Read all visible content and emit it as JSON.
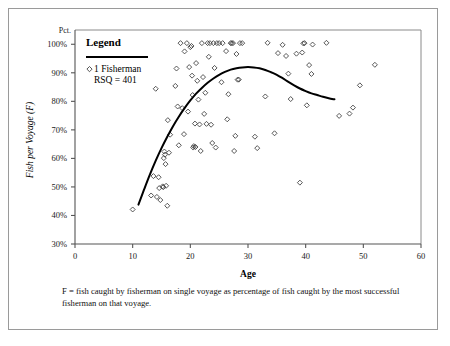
{
  "figure": {
    "y_axis_unit_label": "Pct.",
    "y_axis_title": "Fish per Voyage (F)",
    "x_axis_title": "Age",
    "caption": "F = fish caught by fisherman on single voyage as percentage of fish caught by the most successful fisherman on that voyage."
  },
  "legend": {
    "title": "Legend",
    "marker_label": "1 Fisherman",
    "rsq_label": "RSQ = 401"
  },
  "chart_data": {
    "type": "scatter",
    "title": "",
    "subtitle": "",
    "xlabel": "Age",
    "ylabel": "Fish per Voyage (F)",
    "ylabel_unit": "Pct.",
    "xlim": [
      0,
      60
    ],
    "ylim": [
      30,
      105
    ],
    "xticks": [
      0,
      10,
      20,
      30,
      40,
      50,
      60
    ],
    "yticks": [
      30,
      40,
      50,
      60,
      70,
      80,
      90,
      100
    ],
    "ytick_labels": [
      "30%",
      "40%",
      "50%",
      "60%",
      "70%",
      "80%",
      "90%",
      "100%"
    ],
    "xtick_labels": [
      "0",
      "10",
      "20",
      "30",
      "40",
      "50",
      "60"
    ],
    "grid": false,
    "legend_position": "top-left",
    "series": [
      {
        "name": "1 Fisherman",
        "type": "scatter",
        "marker": "open-diamond",
        "points": [
          [
            10.0,
            42.1
          ],
          [
            13.2,
            47.0
          ],
          [
            13.6,
            53.8
          ],
          [
            14.0,
            84.4
          ],
          [
            14.2,
            46.5
          ],
          [
            14.5,
            53.4
          ],
          [
            14.6,
            49.6
          ],
          [
            14.8,
            45.4
          ],
          [
            15.2,
            50.2
          ],
          [
            15.3,
            49.9
          ],
          [
            15.4,
            60.1
          ],
          [
            15.5,
            62.4
          ],
          [
            15.6,
            61.3
          ],
          [
            15.7,
            58.0
          ],
          [
            15.8,
            50.4
          ],
          [
            16.0,
            43.4
          ],
          [
            16.1,
            73.4
          ],
          [
            16.3,
            62.0
          ],
          [
            16.5,
            68.3
          ],
          [
            17.4,
            85.4
          ],
          [
            17.6,
            91.5
          ],
          [
            17.8,
            78.2
          ],
          [
            18.0,
            64.6
          ],
          [
            18.3,
            100.4
          ],
          [
            18.6,
            77.6
          ],
          [
            18.9,
            68.5
          ],
          [
            19.0,
            97.5
          ],
          [
            19.4,
            100.4
          ],
          [
            19.6,
            76.4
          ],
          [
            19.8,
            92.0
          ],
          [
            20.0,
            99.0
          ],
          [
            20.2,
            99.4
          ],
          [
            20.3,
            89.0
          ],
          [
            20.4,
            82.2
          ],
          [
            20.5,
            63.8
          ],
          [
            20.6,
            64.3
          ],
          [
            20.8,
            72.2
          ],
          [
            20.9,
            64.0
          ],
          [
            21.0,
            93.4
          ],
          [
            21.2,
            87.2
          ],
          [
            21.4,
            80.6
          ],
          [
            21.6,
            71.9
          ],
          [
            21.8,
            62.6
          ],
          [
            22.0,
            100.4
          ],
          [
            22.2,
            88.5
          ],
          [
            22.4,
            75.6
          ],
          [
            22.6,
            83.0
          ],
          [
            22.8,
            72.1
          ],
          [
            23.0,
            100.4
          ],
          [
            23.2,
            95.6
          ],
          [
            23.4,
            100.4
          ],
          [
            23.6,
            71.8
          ],
          [
            23.8,
            65.4
          ],
          [
            24.0,
            100.4
          ],
          [
            24.2,
            91.7
          ],
          [
            24.4,
            63.8
          ],
          [
            24.6,
            100.4
          ],
          [
            25.0,
            100.4
          ],
          [
            25.4,
            86.7
          ],
          [
            25.6,
            100.4
          ],
          [
            26.2,
            97.6
          ],
          [
            26.4,
            73.7
          ],
          [
            26.6,
            82.5
          ],
          [
            27.0,
            100.4
          ],
          [
            27.2,
            100.4
          ],
          [
            27.4,
            100.4
          ],
          [
            27.6,
            62.6
          ],
          [
            27.8,
            67.9
          ],
          [
            28.0,
            96.6
          ],
          [
            28.2,
            87.6
          ],
          [
            28.4,
            87.6
          ],
          [
            28.6,
            100.4
          ],
          [
            29.0,
            100.4
          ],
          [
            31.2,
            67.6
          ],
          [
            31.6,
            63.6
          ],
          [
            33.0,
            81.7
          ],
          [
            33.4,
            100.5
          ],
          [
            34.6,
            68.8
          ],
          [
            35.2,
            96.9
          ],
          [
            36.0,
            99.8
          ],
          [
            36.6,
            95.9
          ],
          [
            37.0,
            89.7
          ],
          [
            37.4,
            80.8
          ],
          [
            38.4,
            96.7
          ],
          [
            39.0,
            51.5
          ],
          [
            39.4,
            97.1
          ],
          [
            39.6,
            100.3
          ],
          [
            39.8,
            100.4
          ],
          [
            40.2,
            78.6
          ],
          [
            40.6,
            92.7
          ],
          [
            41.0,
            89.6
          ],
          [
            41.2,
            99.9
          ],
          [
            43.6,
            100.5
          ],
          [
            45.8,
            74.9
          ],
          [
            47.6,
            75.7
          ],
          [
            48.2,
            77.8
          ],
          [
            49.4,
            85.6
          ],
          [
            52.0,
            92.8
          ]
        ]
      },
      {
        "name": "Fitted curve",
        "type": "line",
        "points": [
          [
            11.0,
            43.8
          ],
          [
            12.0,
            49.2
          ],
          [
            13.0,
            54.4
          ],
          [
            14.0,
            59.2
          ],
          [
            15.0,
            63.6
          ],
          [
            16.0,
            67.6
          ],
          [
            17.0,
            71.3
          ],
          [
            18.0,
            74.6
          ],
          [
            19.0,
            77.6
          ],
          [
            20.0,
            80.3
          ],
          [
            21.0,
            82.7
          ],
          [
            22.0,
            84.7
          ],
          [
            23.0,
            86.5
          ],
          [
            24.0,
            88.0
          ],
          [
            25.0,
            89.3
          ],
          [
            26.0,
            90.3
          ],
          [
            27.0,
            91.1
          ],
          [
            28.0,
            91.6
          ],
          [
            29.0,
            91.9
          ],
          [
            30.0,
            92.0
          ],
          [
            31.0,
            91.9
          ],
          [
            32.0,
            91.6
          ],
          [
            33.0,
            91.0
          ],
          [
            34.0,
            90.2
          ],
          [
            35.0,
            89.3
          ],
          [
            36.0,
            88.1
          ],
          [
            37.0,
            86.8
          ],
          [
            38.0,
            85.6
          ],
          [
            39.0,
            84.5
          ],
          [
            40.0,
            83.6
          ],
          [
            41.0,
            82.8
          ],
          [
            42.0,
            82.2
          ],
          [
            43.0,
            81.6
          ],
          [
            44.0,
            81.1
          ],
          [
            45.0,
            80.7
          ]
        ]
      }
    ]
  }
}
